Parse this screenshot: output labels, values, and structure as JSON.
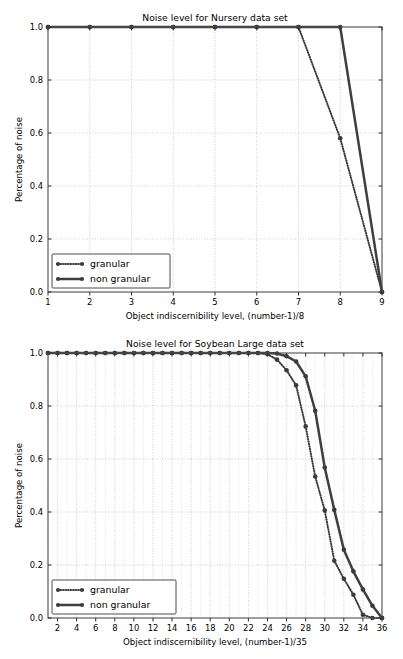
{
  "chart_data": [
    {
      "id": "nursery",
      "type": "line",
      "title": "Noise level for Nursery data set",
      "xlabel": "Object indiscernibility level, (number-1)/8",
      "ylabel": "Percentage of noise",
      "xlim": [
        1,
        9
      ],
      "ylim": [
        0.0,
        1.0
      ],
      "xticks": [
        1,
        2,
        3,
        4,
        5,
        6,
        7,
        8,
        9
      ],
      "xticklabels": [
        "1",
        "2",
        "3",
        "4",
        "5",
        "6",
        "7",
        "8",
        "9"
      ],
      "yticks": [
        0.0,
        0.2,
        0.4,
        0.6,
        0.8,
        1.0
      ],
      "yticklabels": [
        "0.0",
        "0.2",
        "0.4",
        "0.6",
        "0.8",
        "1.0"
      ],
      "grid": true,
      "minor_grid": false,
      "legend_position": "lower left",
      "series": [
        {
          "name": "granular",
          "style": "dotted",
          "x": [
            1,
            2,
            3,
            4,
            5,
            6,
            7,
            8,
            9
          ],
          "values": [
            1.0,
            1.0,
            1.0,
            1.0,
            1.0,
            1.0,
            1.0,
            0.58,
            0.0
          ]
        },
        {
          "name": "non granular",
          "style": "solid",
          "x": [
            1,
            2,
            3,
            4,
            5,
            6,
            7,
            8,
            9
          ],
          "values": [
            1.0,
            1.0,
            1.0,
            1.0,
            1.0,
            1.0,
            1.0,
            1.0,
            0.0
          ]
        }
      ]
    },
    {
      "id": "soybean",
      "type": "line",
      "title": "Noise level for Soybean Large data set",
      "xlabel": "Object indiscernibility level, (number-1)/35",
      "ylabel": "Percentage of noise",
      "xlim": [
        1,
        36
      ],
      "ylim": [
        0.0,
        1.0
      ],
      "xticks": [
        2,
        4,
        6,
        8,
        10,
        12,
        14,
        16,
        18,
        20,
        22,
        24,
        26,
        28,
        30,
        32,
        34,
        36
      ],
      "xticklabels": [
        "2",
        "4",
        "6",
        "8",
        "10",
        "12",
        "14",
        "16",
        "18",
        "20",
        "22",
        "24",
        "26",
        "28",
        "30",
        "32",
        "34",
        "36"
      ],
      "yticks": [
        0.0,
        0.2,
        0.4,
        0.6,
        0.8,
        1.0
      ],
      "yticklabels": [
        "0.0",
        "0.2",
        "0.4",
        "0.6",
        "0.8",
        "1.0"
      ],
      "grid": true,
      "minor_grid": true,
      "legend_position": "lower left",
      "series": [
        {
          "name": "granular",
          "style": "dotted",
          "x": [
            1,
            2,
            3,
            4,
            5,
            6,
            7,
            8,
            9,
            10,
            11,
            12,
            13,
            14,
            15,
            16,
            17,
            18,
            19,
            20,
            21,
            22,
            23,
            24,
            25,
            26,
            27,
            28,
            29,
            30,
            31,
            32,
            33,
            34,
            35,
            36
          ],
          "values": [
            1.0,
            1.0,
            1.0,
            1.0,
            1.0,
            1.0,
            1.0,
            1.0,
            1.0,
            1.0,
            1.0,
            1.0,
            1.0,
            1.0,
            1.0,
            1.0,
            1.0,
            1.0,
            1.0,
            1.0,
            1.0,
            1.0,
            1.0,
            0.995,
            0.975,
            0.935,
            0.878,
            0.723,
            0.534,
            0.406,
            0.216,
            0.148,
            0.088,
            0.012,
            0.0,
            0.0
          ]
        },
        {
          "name": "non granular",
          "style": "solid",
          "x": [
            1,
            2,
            3,
            4,
            5,
            6,
            7,
            8,
            9,
            10,
            11,
            12,
            13,
            14,
            15,
            16,
            17,
            18,
            19,
            20,
            21,
            22,
            23,
            24,
            25,
            26,
            27,
            28,
            29,
            30,
            31,
            32,
            33,
            34,
            35,
            36
          ],
          "values": [
            1.0,
            1.0,
            1.0,
            1.0,
            1.0,
            1.0,
            1.0,
            1.0,
            1.0,
            1.0,
            1.0,
            1.0,
            1.0,
            1.0,
            1.0,
            1.0,
            1.0,
            1.0,
            1.0,
            1.0,
            1.0,
            1.0,
            1.0,
            1.0,
            0.998,
            0.988,
            0.968,
            0.912,
            0.782,
            0.568,
            0.408,
            0.258,
            0.176,
            0.108,
            0.046,
            0.0
          ]
        }
      ]
    }
  ],
  "legend": {
    "granular_label": "granular",
    "nongranular_label": "non granular"
  },
  "colors": {
    "series": "#3b3b3b",
    "grid": "#b8b8b8",
    "spine": "#4d4d4d",
    "background": "#ffffff"
  }
}
